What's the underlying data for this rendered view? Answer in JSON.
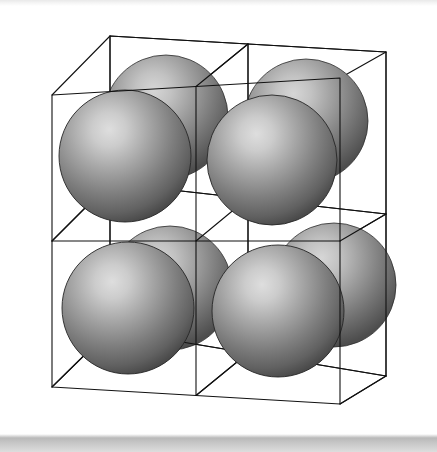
{
  "figure": {
    "kind": "crystal-lattice-diagram",
    "background_color": "#ffffff",
    "top_strip_color": "#e9e9e9",
    "bottom_strip_color": "#b9b9b9",
    "wireframe": {
      "stroke_color": "#111111",
      "stroke_width": 1,
      "subdivisions": 2,
      "label": "cube-wireframe"
    },
    "sphere_style": {
      "highlight_color": "#d8d8d8",
      "mid_color": "#a0a0a0",
      "edge_color": "#4e4e4e",
      "outline_color": "#2a2a2a",
      "highlight_position": "upper-left-of-center"
    },
    "cube_vertices": {
      "front_top_left": [
        52,
        95
      ],
      "front_top_right": [
        340,
        78
      ],
      "front_bottom_left": [
        52,
        387
      ],
      "front_bottom_right": [
        340,
        404
      ],
      "back_top_left": [
        110,
        36
      ],
      "back_top_right": [
        386,
        52
      ],
      "back_bottom_left": [
        110,
        330
      ],
      "back_bottom_right": [
        386,
        376
      ]
    },
    "spheres": [
      {
        "id": "back-top-left",
        "cx": 166,
        "cy": 117,
        "r": 62,
        "layer": "back"
      },
      {
        "id": "back-top-right",
        "cx": 306,
        "cy": 121,
        "r": 62,
        "layer": "back"
      },
      {
        "id": "back-bottom-left",
        "cx": 170,
        "cy": 288,
        "r": 62,
        "layer": "back"
      },
      {
        "id": "back-bottom-right",
        "cx": 334,
        "cy": 285,
        "r": 62,
        "layer": "back"
      },
      {
        "id": "front-top-left",
        "cx": 125,
        "cy": 156,
        "r": 66,
        "layer": "front"
      },
      {
        "id": "front-top-right",
        "cx": 272,
        "cy": 160,
        "r": 65,
        "layer": "front"
      },
      {
        "id": "front-bottom-left",
        "cx": 128,
        "cy": 308,
        "r": 66,
        "layer": "front"
      },
      {
        "id": "front-bottom-right",
        "cx": 278,
        "cy": 311,
        "r": 66,
        "layer": "front"
      }
    ]
  }
}
